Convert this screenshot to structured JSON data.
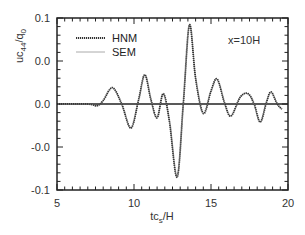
{
  "chart_data": {
    "type": "line",
    "title": "",
    "annotation": "x=10H",
    "xlabel": "tc_s/H",
    "ylabel": "uc_44/q_0",
    "xlim": [
      5,
      20
    ],
    "ylim": [
      -0.1,
      0.1
    ],
    "x_ticks": [
      5,
      10,
      15,
      20
    ],
    "x_tick_labels": [
      "5",
      "10",
      "15",
      "20"
    ],
    "y_ticks": [
      0.1,
      0.05,
      0.0,
      -0.05,
      -0.1
    ],
    "y_tick_labels": [
      "0.1",
      "0.0",
      "0.0",
      "-0.0",
      "-0.1"
    ],
    "grid": false,
    "legend_position": "upper left",
    "zero_line": true,
    "series": [
      {
        "name": "HNM",
        "style": "dotted-thick",
        "color": "#333333",
        "x": [
          5.0,
          7.0,
          7.6,
          8.0,
          8.6,
          9.2,
          9.8,
          10.3,
          10.7,
          11.1,
          11.5,
          11.9,
          12.3,
          12.8,
          13.2,
          13.6,
          14.0,
          14.5,
          15.0,
          15.4,
          15.9,
          16.3,
          16.9,
          17.4,
          17.8,
          18.2,
          18.6,
          18.9,
          19.3,
          19.6
        ],
        "y": [
          0.0,
          0.0,
          -0.002,
          0.004,
          0.019,
          0.0,
          -0.028,
          0.005,
          0.034,
          0.005,
          -0.016,
          0.012,
          -0.02,
          -0.085,
          0.0,
          0.092,
          0.03,
          -0.011,
          0.015,
          0.029,
          0.0,
          -0.014,
          0.008,
          0.012,
          0.0,
          -0.021,
          0.002,
          0.014,
          0.0,
          -0.006
        ]
      },
      {
        "name": "SEM",
        "style": "solid-thin",
        "color": "#888888",
        "x": [
          5.0,
          7.0,
          7.6,
          8.0,
          8.6,
          9.2,
          9.8,
          10.3,
          10.7,
          11.1,
          11.5,
          11.9,
          12.3,
          12.8,
          13.2,
          13.6,
          14.0,
          14.5,
          15.0,
          15.4,
          15.9,
          16.3,
          16.9,
          17.4,
          17.8,
          18.2,
          18.6,
          18.9,
          19.3,
          19.6
        ],
        "y": [
          0.0,
          0.0,
          -0.002,
          0.004,
          0.019,
          0.0,
          -0.028,
          0.005,
          0.034,
          0.005,
          -0.016,
          0.012,
          -0.02,
          -0.085,
          0.0,
          0.092,
          0.03,
          -0.011,
          0.015,
          0.029,
          0.0,
          -0.014,
          0.008,
          0.012,
          0.0,
          -0.021,
          0.002,
          0.014,
          0.0,
          -0.006
        ]
      }
    ]
  },
  "legend": {
    "items": [
      {
        "label": "HNM"
      },
      {
        "label": "SEM"
      }
    ]
  },
  "labels": {
    "annotation": "x=10H",
    "xlabel_main": "tc",
    "xlabel_sub": "s",
    "xlabel_tail": "/H",
    "ylabel_main": "uc",
    "ylabel_sub": "44",
    "ylabel_mid": "/q",
    "ylabel_sub2": "0"
  }
}
